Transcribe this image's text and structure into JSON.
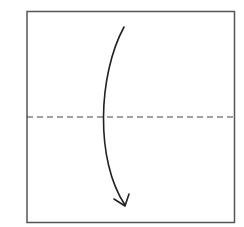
{
  "diagram": {
    "type": "origami-fold-step",
    "colors": {
      "background": "#ffffff",
      "paper_edge": "#555555",
      "fold_line": "#444444",
      "arrow": "#222222"
    },
    "paper": {
      "x": 26,
      "y": 11,
      "width": 209,
      "height": 212
    },
    "fold_line": {
      "style": "dashed",
      "orientation": "horizontal",
      "y": 117
    },
    "arrow": {
      "direction": "down",
      "start": [
        124,
        27
      ],
      "end": [
        125,
        206
      ]
    }
  }
}
